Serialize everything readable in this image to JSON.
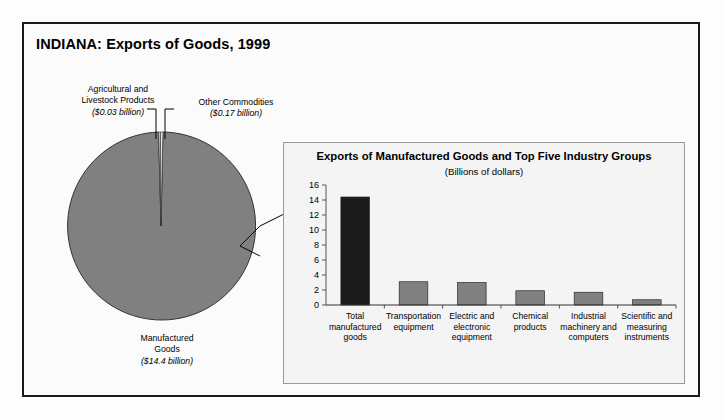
{
  "figure": {
    "title": "INDIANA: Exports of Goods, 1999",
    "border_color": "#1a1a1a",
    "background": "#fbfbfb"
  },
  "pie": {
    "fill_color": "#808080",
    "stroke_color": "#333333",
    "labels": {
      "agricultural": {
        "name": "Agricultural and Livestock Products",
        "line1": "Agricultural and",
        "line2": "Livestock Products",
        "amount": "($0.03 billion)"
      },
      "other": {
        "name": "Other Commodities",
        "line1": "Other Commodities",
        "amount": "($0.17 billion)"
      },
      "manufactured": {
        "name": "Manufactured Goods",
        "line1": "Manufactured",
        "line2": "Goods",
        "amount": "($14.4 billion)"
      }
    }
  },
  "panel": {
    "title": "Exports of Manufactured Goods and Top Five Industry Groups",
    "subtitle": "(Billions of dollars)",
    "border_color": "#9a9a9a",
    "background": "#f4f4f4"
  },
  "chart_data": {
    "type": "pie",
    "title": "INDIANA: Exports of Goods, 1999",
    "labels": [
      "Manufactured Goods",
      "Agricultural and Livestock Products",
      "Other Commodities"
    ],
    "values": [
      14.4,
      0.03,
      0.17
    ],
    "unit": "Billions of dollars",
    "value_labels": [
      "($14.4 billion)",
      "($0.03 billion)",
      "($0.17 billion)"
    ],
    "colors": [
      "#808080",
      "#c9c9c9",
      "#ffffff"
    ],
    "legend": "none",
    "grid": false
  },
  "bar_chart": {
    "type": "bar",
    "title": "Exports of Manufactured Goods and Top Five Industry Groups",
    "subtitle": "(Billions of dollars)",
    "xlabel": "",
    "ylabel": "",
    "ylim": [
      0,
      16
    ],
    "yticks": [
      0,
      2,
      4,
      6,
      8,
      10,
      12,
      14,
      16
    ],
    "ytick_labels": [
      "0",
      "2",
      "4",
      "6",
      "8",
      "10",
      "12",
      "14",
      "16"
    ],
    "grid": false,
    "legend": "none",
    "categories": [
      "Total manufactured goods",
      "Transportation equipment",
      "Electric and electronic equipment",
      "Chemical products",
      "Industrial machinery and computers",
      "Scientific and measuring instruments"
    ],
    "category_lines": [
      [
        "Total",
        "manufactured",
        "goods"
      ],
      [
        "Transportation",
        "equipment"
      ],
      [
        "Electric and",
        "electronic",
        "equipment"
      ],
      [
        "Chemical",
        "products"
      ],
      [
        "Industrial",
        "machinery and",
        "computers"
      ],
      [
        "Scientific and",
        "measuring",
        "instruments"
      ]
    ],
    "values": [
      14.4,
      3.1,
      3.0,
      1.9,
      1.7,
      0.7
    ],
    "bar_colors": [
      "#1a1a1a",
      "#808080",
      "#808080",
      "#808080",
      "#808080",
      "#808080"
    ]
  }
}
